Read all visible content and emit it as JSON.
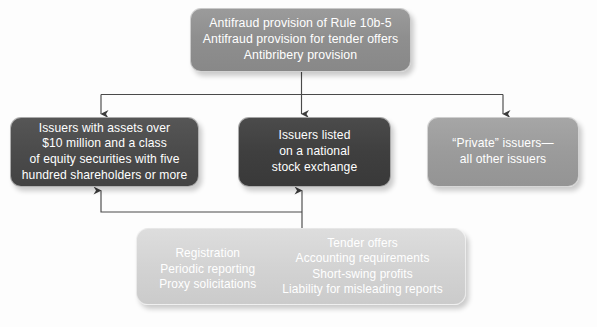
{
  "diagram": {
    "background_color": "#fdfdfd",
    "nodes": {
      "top": {
        "name": "antifraud-provisions",
        "fill": "#8f8f8f",
        "text_color": "#ffffff",
        "lines": [
          "Antifraud provision of Rule 10b-5",
          "Antifraud provision for tender offers",
          "Antibribery provision"
        ]
      },
      "issuers_assets": {
        "name": "issuers-with-assets",
        "fill": "#4b4b4b",
        "text_color": "#ffffff",
        "lines": [
          "Issuers with assets over",
          "$10 million and a class",
          "of equity securities with five",
          "hundred shareholders or more"
        ]
      },
      "issuers_listed": {
        "name": "issuers-listed-exchange",
        "fill": "#3f3f3f",
        "text_color": "#ffffff",
        "lines": [
          "Issuers listed",
          "on a national",
          "stock exchange"
        ]
      },
      "private_issuers": {
        "name": "private-issuers",
        "fill": "#9b9b9b",
        "text_color": "#ffffff",
        "lines": [
          "“Private” issuers—",
          "all other issuers"
        ]
      },
      "requirements": {
        "name": "reporting-requirements",
        "fill": "#d3d3d3",
        "text_color": "#ffffff",
        "left_column": [
          "Registration",
          "Periodic reporting",
          "Proxy solicitations"
        ],
        "right_column": [
          "Tender offers",
          "Accounting requirements",
          "Short-swing profits",
          "Liability for misleading reports"
        ]
      }
    },
    "connectors": {
      "stroke_color": "#4a4a4a",
      "edges": [
        {
          "name": "top-to-issuers-assets",
          "from": "top",
          "to": "issuers_assets",
          "direction": "down"
        },
        {
          "name": "top-to-issuers-listed",
          "from": "top",
          "to": "issuers_listed",
          "direction": "down"
        },
        {
          "name": "top-to-private-issuers",
          "from": "top",
          "to": "private_issuers",
          "direction": "down"
        },
        {
          "name": "requirements-to-issuers-assets",
          "from": "requirements",
          "to": "issuers_assets",
          "direction": "up"
        },
        {
          "name": "requirements-to-issuers-listed",
          "from": "requirements",
          "to": "issuers_listed",
          "direction": "up"
        }
      ]
    }
  }
}
